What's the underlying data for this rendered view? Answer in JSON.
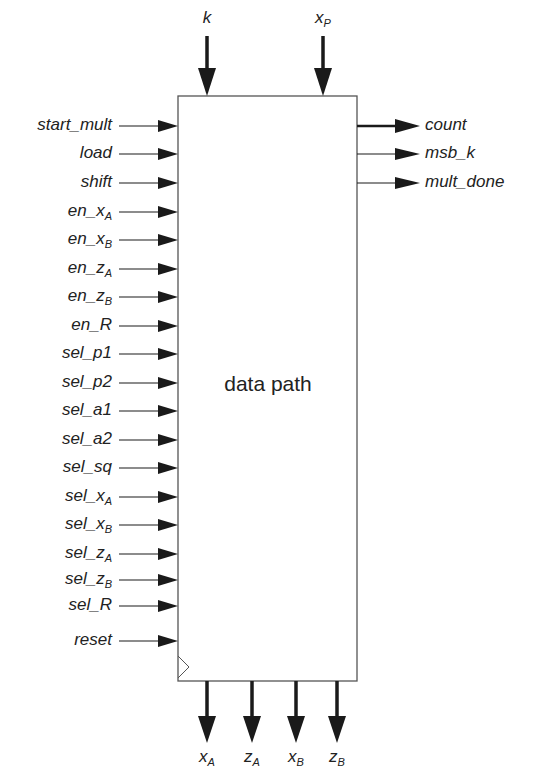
{
  "diagram": {
    "block": {
      "title": "data path",
      "x": 178,
      "y": 96,
      "width": 179,
      "height": 585,
      "clock_marker": true
    },
    "top_inputs": [
      {
        "name": "k",
        "base": "k",
        "sub": "",
        "x": 207
      },
      {
        "name": "xP",
        "base": "x",
        "sub": "P",
        "x": 323
      }
    ],
    "left_inputs": [
      {
        "base": "start_mult",
        "sub": "",
        "y": 126
      },
      {
        "base": "load",
        "sub": "",
        "y": 154
      },
      {
        "base": "shift",
        "sub": "",
        "y": 183
      },
      {
        "base": "en_x",
        "sub": "A",
        "y": 212
      },
      {
        "base": "en_x",
        "sub": "B",
        "y": 240
      },
      {
        "base": "en_z",
        "sub": "A",
        "y": 269
      },
      {
        "base": "en_z",
        "sub": "B",
        "y": 297
      },
      {
        "base": "en_R",
        "sub": "",
        "y": 326
      },
      {
        "base": "sel_p1",
        "sub": "",
        "y": 354
      },
      {
        "base": "sel_p2",
        "sub": "",
        "y": 383
      },
      {
        "base": "sel_a1",
        "sub": "",
        "y": 411
      },
      {
        "base": "sel_a2",
        "sub": "",
        "y": 440
      },
      {
        "base": "sel_sq",
        "sub": "",
        "y": 468
      },
      {
        "base": "sel_x",
        "sub": "A",
        "y": 497
      },
      {
        "base": "sel_x",
        "sub": "B",
        "y": 525
      },
      {
        "base": "sel_z",
        "sub": "A",
        "y": 554
      },
      {
        "base": "sel_z",
        "sub": "B",
        "y": 580
      },
      {
        "base": "sel_R",
        "sub": "",
        "y": 606
      },
      {
        "base": "reset",
        "sub": "",
        "y": 641
      }
    ],
    "right_outputs": [
      {
        "base": "count",
        "sub": "",
        "y": 126,
        "bus": true
      },
      {
        "base": "msb_k",
        "sub": "",
        "y": 154,
        "bus": false
      },
      {
        "base": "mult_done",
        "sub": "",
        "y": 183,
        "bus": false
      }
    ],
    "bottom_outputs": [
      {
        "base": "x",
        "sub": "A",
        "x": 207
      },
      {
        "base": "z",
        "sub": "A",
        "x": 252
      },
      {
        "base": "x",
        "sub": "B",
        "x": 296
      },
      {
        "base": "z",
        "sub": "B",
        "x": 337
      }
    ],
    "colors": {
      "line": "#1a1a1a",
      "box": "#555555",
      "background": "#ffffff"
    }
  }
}
